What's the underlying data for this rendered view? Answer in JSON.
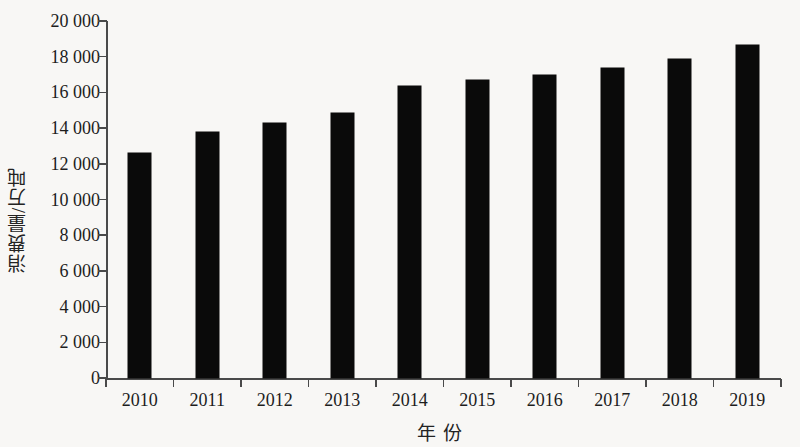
{
  "chart_data": {
    "type": "bar",
    "title": "",
    "xlabel": "年 份",
    "ylabel": "消费量/万吨",
    "categories": [
      "2010",
      "2011",
      "2012",
      "2013",
      "2014",
      "2015",
      "2016",
      "2017",
      "2018",
      "2019"
    ],
    "values": [
      12600,
      13800,
      14300,
      14850,
      16350,
      16700,
      16950,
      17350,
      17900,
      18650
    ],
    "value_labels": [
      "12 600",
      "13 800",
      "14 300",
      "14 850",
      "16 350",
      "16 700",
      "16 950",
      "17 350",
      "17 900",
      "18 650"
    ],
    "series": [
      {
        "name": "消费量",
        "values": [
          12600,
          13800,
          14300,
          14850,
          16350,
          16700,
          16950,
          17350,
          17900,
          18650
        ],
        "color": "#0a0a0a"
      }
    ],
    "ylim": [
      0,
      20000
    ],
    "ytick_values": [
      0,
      2000,
      4000,
      6000,
      8000,
      10000,
      12000,
      14000,
      16000,
      18000,
      20000
    ],
    "ytick_labels": [
      "0",
      "2 000",
      "4 000",
      "6 000",
      "8 000",
      "10 000",
      "12 000",
      "14 000",
      "16 000",
      "18 000",
      "20 000"
    ],
    "grid": false,
    "legend": null,
    "legend_position": "none",
    "bar_color": "#0a0a0a",
    "background_color": "#f8f7f5",
    "axis_color": "#4a4a4a"
  }
}
